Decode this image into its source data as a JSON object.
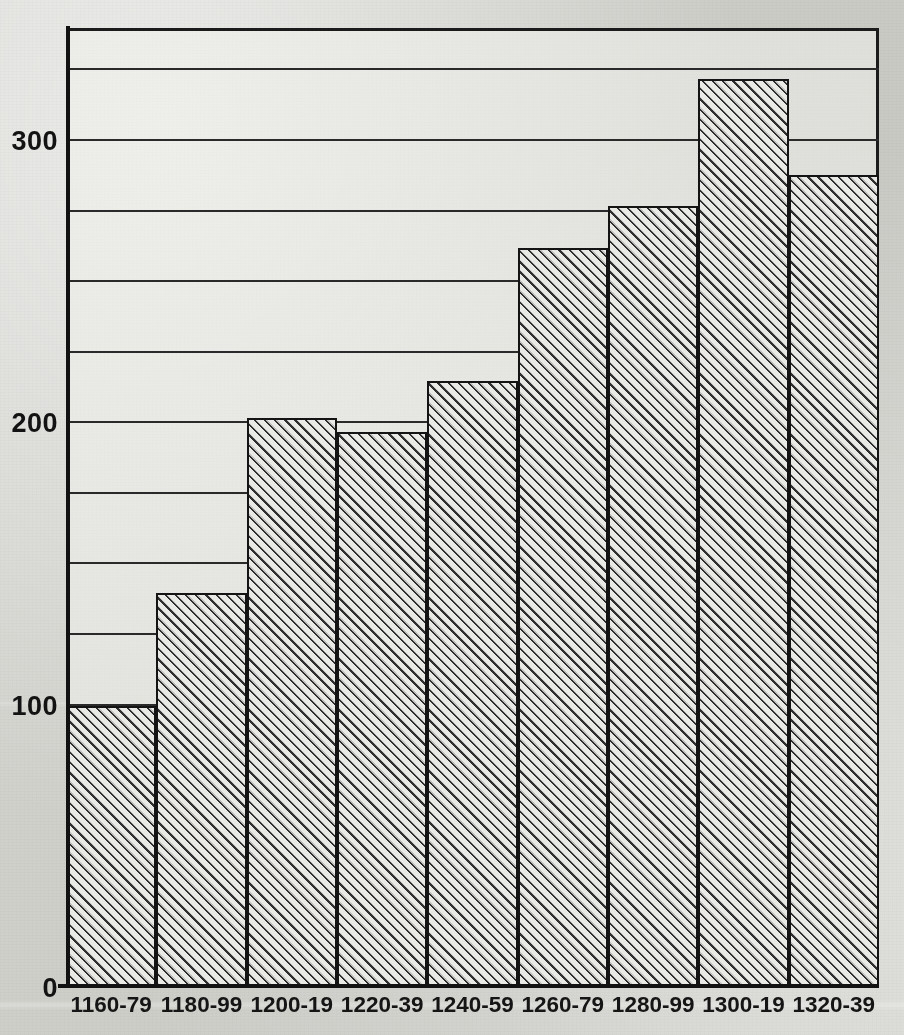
{
  "chart_data": {
    "type": "bar",
    "title": "",
    "subtitle": "",
    "xlabel": "",
    "ylabel": "",
    "categories": [
      "1160-79",
      "1180-99",
      "1200-19",
      "1220-39",
      "1240-59",
      "1260-79",
      "1280-99",
      "1300-19",
      "1320-39"
    ],
    "values": [
      100,
      140,
      202,
      197,
      215,
      262,
      277,
      322,
      288
    ],
    "series": [
      {
        "name": "count",
        "values": [
          100,
          140,
          202,
          197,
          215,
          262,
          277,
          322,
          288
        ]
      }
    ],
    "ylim": [
      0,
      340
    ],
    "y_tick_labels": [
      "0",
      "100",
      "200",
      "300"
    ],
    "y_tick_values": [
      0,
      100,
      200,
      300
    ],
    "gridline_interval": 25,
    "gridline_values": [
      25,
      50,
      75,
      100,
      125,
      150,
      175,
      200,
      225,
      250,
      275,
      300,
      325
    ],
    "grid": true,
    "legend": false,
    "legend_position": "none",
    "bar_style": "diagonal-hatch",
    "bar_gap": 0,
    "axis_color": "#121212",
    "bar_fill": "#e9e9e6",
    "bar_hatch_color": "#2f2f2f",
    "background_color": "#cfcfca"
  },
  "axes": {
    "y_ticks": [
      {
        "label": "0",
        "value": 0
      },
      {
        "label": "100",
        "value": 100
      },
      {
        "label": "200",
        "value": 200
      },
      {
        "label": "300",
        "value": 300
      }
    ]
  }
}
